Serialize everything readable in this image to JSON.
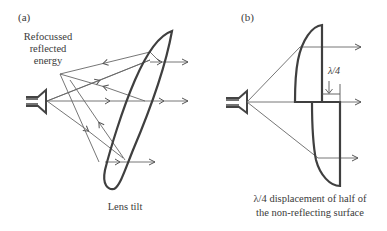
{
  "panels": [
    {
      "id": "a",
      "label": "(a)",
      "annotation_lines": [
        "Refocussed",
        "reflected",
        "energy"
      ],
      "caption": "Lens tilt"
    },
    {
      "id": "b",
      "label": "(b)",
      "dimension_label": "λ/4",
      "caption_lines": [
        "λ/4 displacement of half of",
        "the non-reflecting surface"
      ]
    }
  ],
  "colors": {
    "line": "#555555",
    "lens": "#3f3f3f",
    "text": "#3a3a3a",
    "background": "#ffffff"
  }
}
